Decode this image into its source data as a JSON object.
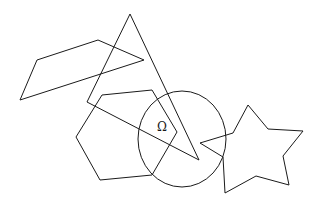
{
  "diagram": {
    "background": "#ffffff",
    "stroke_color": "#1a1a1a",
    "shapes": {
      "quadrilateral": {
        "points": "37,60 98,40 144,60 20,100"
      },
      "triangle": {
        "points": "130,14 87,102 199,160"
      },
      "hexagon": {
        "points": "102,95 152,90 177,132 152,175 100,180 76,137"
      },
      "circle": {
        "cx": 182,
        "cy": 139,
        "rx": 44,
        "ry": 48
      },
      "star": {
        "points": "248,105 268,129 303,131 283,156 289,185 256,176 225,193 223,157 200,143 233,133"
      }
    },
    "label": {
      "text": "Ω",
      "x": 162,
      "y": 131
    }
  }
}
